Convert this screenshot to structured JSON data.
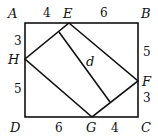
{
  "diagram": {
    "points": {
      "A": {
        "label": "A",
        "x": 25,
        "y": 23
      },
      "B": {
        "label": "B",
        "x": 138,
        "y": 23
      },
      "C": {
        "label": "C",
        "x": 138,
        "y": 117
      },
      "D": {
        "label": "D",
        "x": 25,
        "y": 117
      },
      "E": {
        "label": "E",
        "x": 69,
        "y": 23
      },
      "F": {
        "label": "F",
        "x": 138,
        "y": 81
      },
      "G": {
        "label": "G",
        "x": 92,
        "y": 117
      },
      "H": {
        "label": "H",
        "x": 25,
        "y": 59
      }
    },
    "segment_lengths": {
      "AE": "4",
      "EB": "6",
      "AH": "3",
      "HD": "5",
      "BF": "5",
      "FC": "3",
      "DG": "6",
      "GC": "4"
    },
    "diagonal_label": "d"
  }
}
